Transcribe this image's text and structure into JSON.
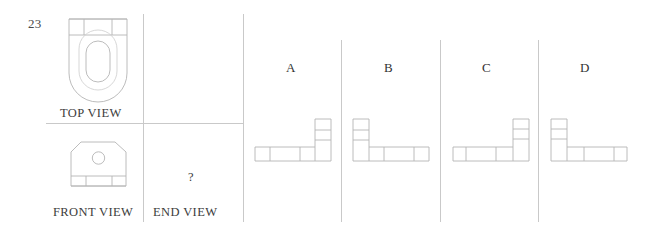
{
  "question": {
    "number": "23",
    "type": "orthographic-projection-multiple-choice",
    "prompt_symbol": "?"
  },
  "given_views": [
    {
      "key": "top",
      "label": "TOP VIEW",
      "description": "U-shaped plate outline, rounded lower end, internal elongated slot, top band divided into three segments"
    },
    {
      "key": "front",
      "label": "FRONT VIEW",
      "description": "Plate with chamfered upper corners, central circular hole, bottom band divided into three segments"
    },
    {
      "key": "end",
      "label": "END VIEW",
      "description": "Unknown view to be identified"
    }
  ],
  "options": [
    {
      "letter": "A",
      "description": "L-shape, vertical leg on right, horizontal leg extends left"
    },
    {
      "letter": "B",
      "description": "L-shape, vertical leg on left, horizontal leg extends right"
    },
    {
      "letter": "C",
      "description": "L-shape, vertical leg on right, horizontal leg extends left"
    },
    {
      "letter": "D",
      "description": "L-shape, vertical leg on left, horizontal leg extends right"
    }
  ],
  "colors": {
    "background": "#ffffff",
    "line": "#b4b4b4",
    "line_soft": "#cdcdcd",
    "rule": "#c9c9c9",
    "text": "#3a3a3a"
  }
}
